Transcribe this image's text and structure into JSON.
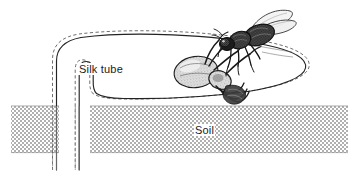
{
  "figure": {
    "background_color": "#ffffff",
    "width": 359,
    "height": 178
  },
  "labels": {
    "silk_tube": "Silk tube",
    "soil": "Soil"
  },
  "colors": {
    "ink": "#1a1a1a",
    "line": "#2b2b2b",
    "soil_fill": "#b8b8b8",
    "soil_light": "#ffffff",
    "soil_edge": "#9a9a9a",
    "spider_body": "#d8d8d8",
    "wing_fill": "#f2f2f2",
    "label_text": "#1a1a1a"
  },
  "elements": {
    "silk_tube_label": "Silk tube",
    "soil_label": "Soil",
    "soil_band_left": "soil-band-left",
    "soil_band_right": "soil-band-right",
    "tube_outline": "tube-outline-solid",
    "tube_dashed": "tube-outline-dashed",
    "spider": "spider-illustration",
    "fly": "fly-illustration"
  },
  "annotations": [
    {
      "name": "silk-tube",
      "text": "Silk tube",
      "x": 78,
      "y": 63
    },
    {
      "name": "soil",
      "text": "Soil",
      "x": 194,
      "y": 124
    }
  ]
}
